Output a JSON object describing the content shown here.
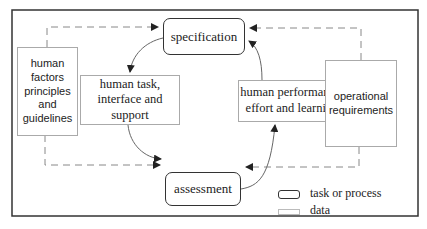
{
  "diagram": {
    "processes": [
      {
        "id": "specification",
        "label": "specification"
      },
      {
        "id": "assessment",
        "label": "assessment"
      }
    ],
    "data_nodes": [
      {
        "id": "human-factors",
        "label": "human factors principles and guidelines",
        "lines": [
          "human",
          "factors",
          "principles",
          "and",
          "guidelines"
        ]
      },
      {
        "id": "human-task",
        "label": "human task, interface and support",
        "lines": [
          "human task,",
          "interface and support"
        ]
      },
      {
        "id": "human-performance",
        "label": "human performance, effort and learning",
        "lines": [
          "human performance,",
          "effort and learning"
        ]
      },
      {
        "id": "operational",
        "label": "operational requirements",
        "lines": [
          "operational",
          "requirements"
        ]
      }
    ],
    "edges": [
      {
        "from": "specification",
        "to": "human-task",
        "style": "solid-curve"
      },
      {
        "from": "human-task",
        "to": "assessment",
        "style": "solid-curve"
      },
      {
        "from": "assessment",
        "to": "human-performance",
        "style": "solid-curve"
      },
      {
        "from": "human-performance",
        "to": "specification",
        "style": "solid-curve"
      },
      {
        "from": "human-factors",
        "to": "specification",
        "style": "dashed"
      },
      {
        "from": "human-factors",
        "to": "assessment",
        "style": "dashed"
      },
      {
        "from": "operational",
        "to": "specification",
        "style": "dashed"
      },
      {
        "from": "operational",
        "to": "assessment",
        "style": "dashed"
      }
    ],
    "legend": [
      {
        "symbol": "rounded-box",
        "label": "task or process"
      },
      {
        "symbol": "plain-box",
        "label": "data"
      }
    ],
    "colors": {
      "frame": "#333333",
      "process_border": "#333333",
      "data_border": "#aaaaaa",
      "dashed": "#888888",
      "text": "#222222"
    }
  }
}
